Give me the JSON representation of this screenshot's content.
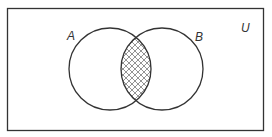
{
  "diagram": {
    "type": "venn",
    "universe_label": "U",
    "sets": [
      {
        "label": "A"
      },
      {
        "label": "B"
      }
    ],
    "shaded_region": "A ∩ B",
    "shading_pattern": "crosshatch",
    "colors": {
      "stroke": "#333333",
      "background": "#ffffff",
      "hatch": "#666666"
    }
  }
}
